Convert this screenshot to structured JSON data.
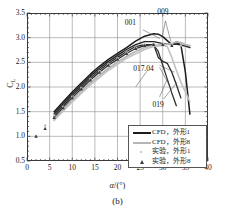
{
  "figure": {
    "subcaption": "(b)",
    "axis_color": "#3a3a3a",
    "grid_color": "#8f8f8f"
  },
  "chart_data": {
    "type": "line",
    "title": "",
    "subtitle": "",
    "xlabel": "α/(°)",
    "ylabel": "C_L",
    "xlim": [
      0,
      40
    ],
    "ylim": [
      0.5,
      3.5
    ],
    "xticks": [
      0,
      5,
      10,
      15,
      20,
      25,
      30,
      35,
      40
    ],
    "yticks": [
      0.5,
      1.0,
      1.5,
      2.0,
      2.5,
      3.0,
      3.5
    ],
    "xtick_labels": [
      "0",
      "5",
      "10",
      "15",
      "20",
      "25",
      "30",
      "35",
      "40"
    ],
    "ytick_labels": [
      "0.5",
      "1.0",
      "1.5",
      "2.0",
      "2.5",
      "3.0",
      "3.5"
    ],
    "grid": true,
    "legend_position": "lower right",
    "annotations": [
      {
        "label": "001",
        "x": 24.5,
        "y": 3.22
      },
      {
        "label": "009",
        "x": 31.0,
        "y": 3.42
      },
      {
        "label": "017.04",
        "x": 27.0,
        "y": 2.37
      },
      {
        "label": "019",
        "x": 29.5,
        "y": 1.72
      }
    ],
    "legend": [
      {
        "label": "CFD，外形1",
        "marker": "line",
        "color": "#1c1c1c"
      },
      {
        "label": "CFD，外形8",
        "marker": "line",
        "color": "#b5b5b5"
      },
      {
        "label": "实验，外形1",
        "marker": "dot",
        "color": "#bdbdbd"
      },
      {
        "label": "实验，外形8",
        "marker": "triangle",
        "color": "#3c3c3c"
      }
    ],
    "series": [
      {
        "name": "CFD，外形1 (001)",
        "color": "#1c1c1c",
        "width": 1.5,
        "x": [
          6,
          8,
          10,
          12,
          14,
          16,
          18,
          20,
          22,
          24,
          26,
          28,
          29,
          30,
          31,
          32,
          33,
          34,
          35,
          36
        ],
        "y": [
          1.5,
          1.7,
          1.9,
          2.08,
          2.26,
          2.42,
          2.56,
          2.68,
          2.8,
          2.93,
          3.03,
          3.08,
          3.07,
          3.02,
          2.94,
          2.86,
          2.9,
          2.86,
          2.3,
          1.45
        ]
      },
      {
        "name": "CFD，外形1 (009)",
        "color": "#222222",
        "width": 1.4,
        "x": [
          6,
          8,
          10,
          12,
          14,
          16,
          18,
          20,
          22,
          24,
          26,
          28,
          30,
          31,
          32,
          33,
          34,
          35,
          36
        ],
        "y": [
          1.46,
          1.66,
          1.86,
          2.04,
          2.22,
          2.38,
          2.52,
          2.64,
          2.76,
          2.86,
          2.92,
          2.92,
          2.88,
          2.87,
          2.86,
          2.87,
          2.85,
          2.83,
          2.8
        ]
      },
      {
        "name": "CFD，外形1 (017.04)",
        "color": "#2a2a2a",
        "width": 1.3,
        "x": [
          6,
          8,
          10,
          12,
          14,
          16,
          18,
          20,
          22,
          24,
          26,
          28,
          29,
          30,
          31,
          32,
          33,
          34
        ],
        "y": [
          1.42,
          1.62,
          1.82,
          2.0,
          2.18,
          2.34,
          2.48,
          2.6,
          2.72,
          2.82,
          2.86,
          2.86,
          2.6,
          2.52,
          2.48,
          2.3,
          2.05,
          1.78
        ]
      },
      {
        "name": "CFD，外形1 (019)",
        "color": "#303030",
        "width": 1.3,
        "x": [
          6,
          8,
          10,
          12,
          14,
          16,
          18,
          20,
          22,
          24,
          26,
          28,
          29,
          30,
          31,
          32,
          33
        ],
        "y": [
          1.38,
          1.58,
          1.78,
          1.96,
          2.14,
          2.3,
          2.44,
          2.56,
          2.68,
          2.78,
          2.84,
          2.85,
          2.72,
          2.44,
          2.16,
          1.88,
          1.62
        ]
      },
      {
        "name": "CFD，外形8",
        "color": "#b5b5b5",
        "width": 1.8,
        "x": [
          6,
          8,
          10,
          12,
          14,
          16,
          18,
          20,
          22,
          24,
          26,
          28,
          30,
          32,
          33,
          34,
          35,
          36
        ],
        "y": [
          1.34,
          1.54,
          1.74,
          1.92,
          2.08,
          2.24,
          2.38,
          2.5,
          2.62,
          2.72,
          2.8,
          2.84,
          2.86,
          2.88,
          2.92,
          2.9,
          2.86,
          2.84
        ]
      },
      {
        "name": "CFD，外形8 b",
        "color": "#c2c2c2",
        "width": 1.6,
        "x": [
          6,
          10,
          14,
          18,
          22,
          26,
          28,
          30,
          31,
          32,
          33,
          34,
          35,
          36
        ],
        "y": [
          1.32,
          1.7,
          2.04,
          2.34,
          2.58,
          2.76,
          2.82,
          2.84,
          2.82,
          2.6,
          2.34,
          2.1,
          1.9,
          1.7
        ]
      }
    ],
    "scatter": [
      {
        "name": "实验，外形1",
        "marker": "dot",
        "color": "#bdbdbd",
        "x": [
          2,
          4,
          6,
          8,
          10,
          12,
          14,
          16,
          18,
          20,
          22,
          24,
          26,
          28,
          30,
          32,
          34
        ],
        "y": [
          1.0,
          1.22,
          1.42,
          1.6,
          1.8,
          1.98,
          2.16,
          2.32,
          2.46,
          2.58,
          2.7,
          2.8,
          2.86,
          2.88,
          2.88,
          2.86,
          2.84
        ]
      },
      {
        "name": "实验，外形8",
        "marker": "triangle",
        "color": "#3c3c3c",
        "x": [
          2,
          4,
          6,
          8,
          10,
          12,
          14,
          16,
          18,
          20,
          22,
          24,
          26,
          28,
          30,
          32
        ],
        "y": [
          1.0,
          1.16,
          1.38,
          1.58,
          1.78,
          1.96,
          2.14,
          2.3,
          2.44,
          2.56,
          2.68,
          2.78,
          2.84,
          2.86,
          2.86,
          2.84
        ]
      }
    ]
  }
}
